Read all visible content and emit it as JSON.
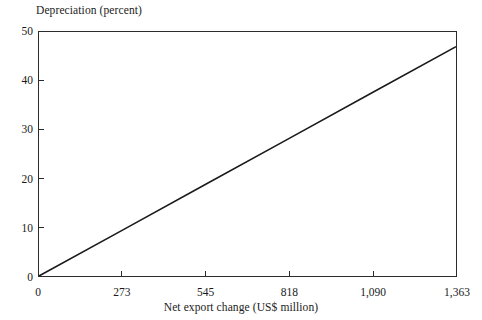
{
  "chart_data": {
    "type": "line",
    "title": "",
    "xlabel": "Net export change (US$ million)",
    "ylabel": "Depreciation (percent)",
    "xlim": [
      0,
      1363
    ],
    "ylim": [
      0,
      50
    ],
    "xticks": [
      0,
      273,
      545,
      818,
      1090,
      1363
    ],
    "xticklabels": [
      "0",
      "273",
      "545",
      "818",
      "1,090",
      "1,363"
    ],
    "yticks": [
      0,
      10,
      20,
      30,
      40,
      50
    ],
    "yticklabels": [
      "0",
      "10",
      "20",
      "30",
      "40",
      "50"
    ],
    "grid": false,
    "legend": false,
    "series": [
      {
        "name": "depreciation-vs-net-export-change",
        "color": "#1a1a1a",
        "x": [
          0,
          273,
          545,
          818,
          1090,
          1363
        ],
        "values": [
          0.0,
          9.4,
          18.8,
          28.2,
          37.6,
          47.0
        ]
      }
    ]
  },
  "axes": {
    "y_title": "Depreciation (percent)",
    "x_title": "Net export change (US$ million)"
  },
  "colors": {
    "background": "#ffffff",
    "frame": "#2b2b2b",
    "line": "#1a1a1a",
    "text": "#1a1a1a"
  }
}
